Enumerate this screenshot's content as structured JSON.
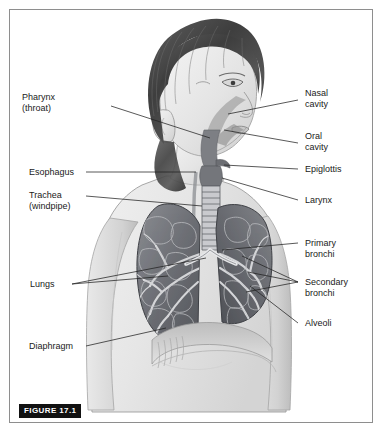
{
  "figure": {
    "badge": "FIGURE 17.1",
    "style": "grayscale pencil anatomical drawing of a girl, head and upper torso, three-quarter view",
    "background_color": "#ffffff",
    "border_color": "#8e8e8e",
    "label_color": "#1a1a1a",
    "leader_color": "#222222",
    "lung_color": "#6f7176",
    "skin_color": "#ededed",
    "hair_color": "#4a4a4a"
  },
  "labels": {
    "pharynx": {
      "line1": "Pharynx",
      "line2": "(throat)"
    },
    "esophagus": {
      "line1": "Esophagus"
    },
    "trachea": {
      "line1": "Trachea",
      "line2": "(windpipe)"
    },
    "lungs": {
      "line1": "Lungs"
    },
    "diaphragm": {
      "line1": "Diaphragm"
    },
    "nasal_cavity": {
      "line1": "Nasal",
      "line2": "cavity"
    },
    "oral_cavity": {
      "line1": "Oral",
      "line2": "cavity"
    },
    "epiglottis": {
      "line1": "Epiglottis"
    },
    "larynx": {
      "line1": "Larynx"
    },
    "primary_bronchi": {
      "line1": "Primary",
      "line2": "bronchi"
    },
    "secondary_bronchi": {
      "line1": "Secondary",
      "line2": "bronchi"
    },
    "alveoli": {
      "line1": "Alveoli"
    }
  }
}
